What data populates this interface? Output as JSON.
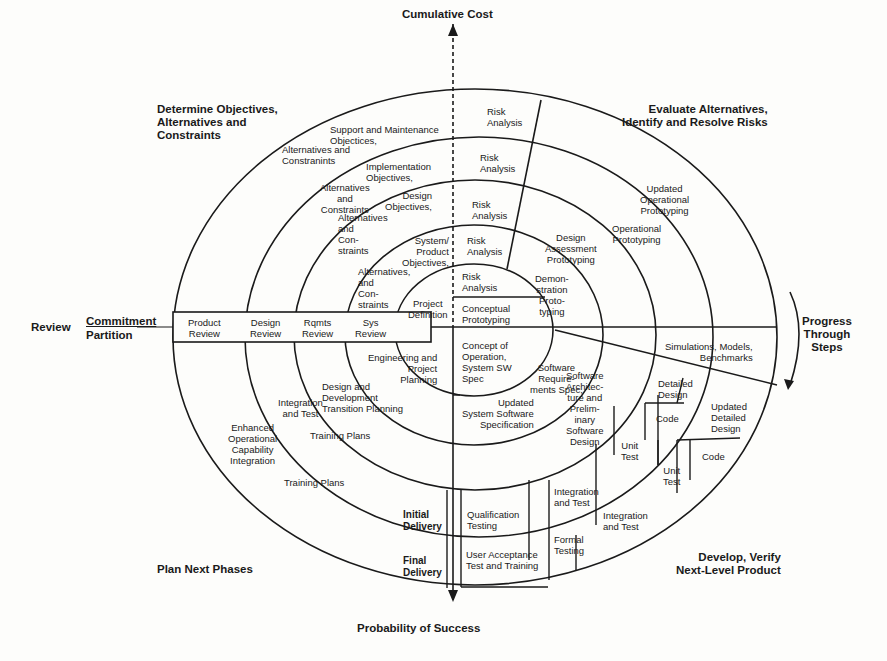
{
  "diagram": {
    "axes": {
      "top": "Cumulative Cost",
      "bottom": "Probability of Success"
    },
    "quadrants": {
      "top_left": "Determine Objectives,\nAlternatives and\nConstraints",
      "top_right": "Evaluate Alternatives,\nIdentify and Resolve Risks",
      "bottom_left": "Plan Next Phases",
      "bottom_right": "Develop, Verify\nNext-Level Product"
    },
    "left_band": {
      "review": "Review",
      "commitment": "Commitment",
      "partition": "Partition",
      "cells": [
        "Product\nReview",
        "Design\nReview",
        "Rqmts\nReview",
        "Sys\nReview"
      ]
    },
    "progress": "Progress\nThrough\nSteps",
    "objectives": [
      "Support and Maintenance\nObjectices,",
      "Alternatives and\nConstranints",
      "Implementation\nObjectives,",
      "Alternatives\nand\nConstraints",
      "Design\nObjectives,",
      "Alternatives\nand\nCon-\nstraints",
      "System/\nProduct\nObjectives,",
      "Alternatives,\nand\nCon-\nstraints",
      "Project\nDefinition"
    ],
    "risk_analysis": [
      "Risk\nAnalysis",
      "Risk\nAnalysis",
      "Risk\nAnalysis",
      "Risk\nAnalysis",
      "Risk\nAnalysis"
    ],
    "prototypes": {
      "conceptual": "Conceptual\nPrototyping",
      "demonstration": "Demon-\nstration\nProto-\ntyping",
      "design_assessment": "Design\nAssessment\nPrototyping",
      "operational": "Operational\nPrototyping",
      "updated_operational": "Updated\nOperational\nPrototyping"
    },
    "simulations": "Simulations, Models,\nBenchmarks",
    "plans": {
      "engineering": "Engineering and\nProject\nPlanning",
      "design_dev": "Design and\nDevelopment\nTransition Planning",
      "integration": "Integration\nand Test",
      "training1": "Training Plans",
      "enhanced": "Enhanced\nOperational\nCapability\nIntegration",
      "training2": "Training Plans"
    },
    "develop": {
      "concept_op": "Concept of\nOperation,\nSystem SW\nSpec",
      "sys_sw_spec": "Updated\nSystem Software\nSpecification",
      "sw_req": "Software\nRequire-\nments Spec,",
      "sw_arch": "Software\nArchitec-\nture and\nPrelim-\ninary\nSoftware\nDesign",
      "detailed_design": "Detailed\nDesign",
      "updated_detailed": "Updated\nDetailed\nDesign",
      "code1": "Code",
      "code2": "Code",
      "unit_test1": "Unit\nTest",
      "unit_test2": "Unit\nTest",
      "integ1": "Integration\nand Test",
      "integ2": "Integration\nand Test",
      "qualification": "Qualification\nTesting",
      "formal": "Formal\nTesting",
      "uat": "User Acceptance\nTest and Training",
      "initial_delivery": "Initial\nDelivery",
      "final_delivery": "Final\nDelivery"
    }
  }
}
